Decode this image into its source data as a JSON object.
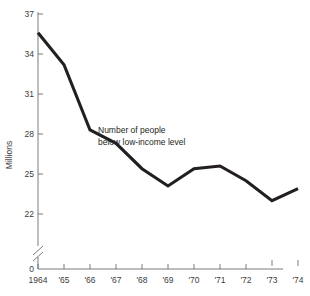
{
  "chart_data": {
    "type": "line",
    "title": "",
    "subtitle": "",
    "xlabel": "",
    "ylabel": "Millions",
    "x": [
      1964,
      1965,
      1966,
      1967,
      1968,
      1969,
      1970,
      1971,
      1972,
      1973,
      1974
    ],
    "categories": [
      "1964",
      "'65",
      "'66",
      "'67",
      "'68",
      "'69",
      "'70",
      "'71",
      "'72",
      "'73",
      "'74"
    ],
    "series": [
      {
        "name": "Number of people below low-income level",
        "values": [
          35.6,
          33.2,
          28.3,
          27.3,
          25.4,
          24.1,
          25.4,
          25.6,
          24.5,
          23.0,
          23.9
        ]
      }
    ],
    "ylim": [
      22,
      37
    ],
    "yticks": [
      22,
      25,
      28,
      31,
      34,
      37
    ],
    "ytick_labels": [
      "22",
      "25",
      "28",
      "31",
      "34",
      "37"
    ],
    "y_origin_label": "0",
    "y_axis_break": true,
    "xlim": [
      1964,
      1974
    ],
    "grid": false,
    "legend": "none",
    "annotations": [
      {
        "name": "series-annotation",
        "line1": "Number of people",
        "line2": "below low-income level"
      }
    ],
    "colors": {
      "line": "#231f20",
      "axis": "#6e6e6e",
      "text": "#3b3b3b",
      "background": "#ffffff"
    }
  }
}
